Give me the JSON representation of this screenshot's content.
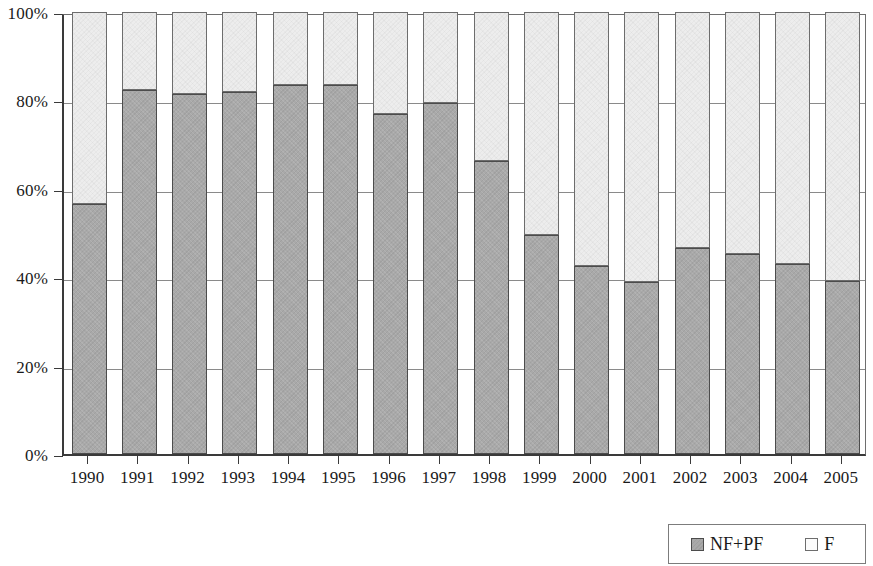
{
  "chart_data": {
    "type": "bar",
    "subtype": "100% stacked bar",
    "title": "",
    "xlabel": "",
    "ylabel": "",
    "ylim": [
      0,
      100
    ],
    "ytick_labels": [
      "0%",
      "20%",
      "40%",
      "60%",
      "80%",
      "100%"
    ],
    "ytick_values": [
      0,
      20,
      40,
      60,
      80,
      100
    ],
    "grid": true,
    "legend_position": "bottom-right",
    "stacked_to_100": true,
    "categories": [
      "1990",
      "1991",
      "1992",
      "1993",
      "1994",
      "1995",
      "1996",
      "1997",
      "1998",
      "1999",
      "2000",
      "2001",
      "2002",
      "2003",
      "2004",
      "2005"
    ],
    "series": [
      {
        "name": "NF+PF",
        "color": "#a9a9a9",
        "stack_order": 0,
        "values": [
          56.6,
          82.3,
          81.4,
          82.0,
          83.6,
          83.6,
          77.0,
          79.5,
          66.4,
          49.5,
          42.5,
          38.9,
          46.6,
          45.2,
          43.0,
          39.1
        ]
      },
      {
        "name": "F",
        "color": "#ededed",
        "stack_order": 1,
        "values": [
          43.4,
          17.7,
          18.6,
          18.0,
          16.4,
          16.4,
          23.0,
          20.5,
          33.6,
          50.5,
          57.5,
          61.1,
          53.4,
          54.8,
          57.0,
          60.9
        ]
      }
    ]
  },
  "legend": {
    "entries": [
      {
        "label": "NF+PF",
        "swatch": "gray"
      },
      {
        "label": "F",
        "swatch": "white"
      }
    ]
  }
}
